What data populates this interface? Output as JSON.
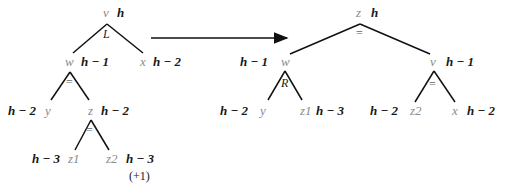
{
  "diagram": {
    "before_tree": {
      "root": {
        "name": "v",
        "height": "h",
        "balance": "L"
      },
      "root_left": {
        "name": "w",
        "height": "h − 1",
        "balance": "="
      },
      "root_right": {
        "name": "x",
        "height": "h − 2"
      },
      "w_left": {
        "name": "y",
        "height": "h − 2"
      },
      "w_right": {
        "name": "z",
        "height": "h − 2",
        "balance": "="
      },
      "z_left": {
        "name": "z1",
        "height": "h − 3"
      },
      "z_right": {
        "name": "z2",
        "height": "h − 3",
        "note": "(+1)"
      }
    },
    "after_tree": {
      "root": {
        "name": "z",
        "height": "h",
        "balance": "="
      },
      "root_left": {
        "name": "w",
        "height": "h − 1",
        "balance": "R"
      },
      "root_right": {
        "name": "v",
        "height": "h − 1",
        "balance": "="
      },
      "w_left": {
        "name": "y",
        "height": "h − 2"
      },
      "w_right": {
        "name": "z1",
        "height": "h − 3"
      },
      "v_left": {
        "name": "z2",
        "height": "h − 2"
      },
      "v_right": {
        "name": "x",
        "height": "h − 2"
      }
    },
    "arrow": "transformation-arrow"
  }
}
